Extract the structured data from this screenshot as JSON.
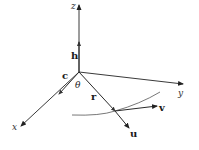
{
  "diagram": {
    "type": "3d-vector-diagram",
    "axes": {
      "x": {
        "label": "x"
      },
      "y": {
        "label": "y"
      },
      "z": {
        "label": "z"
      }
    },
    "vectors": {
      "h": {
        "label": "h"
      },
      "c": {
        "label": "c"
      },
      "r": {
        "label": "r"
      },
      "u": {
        "label": "u"
      },
      "v": {
        "label": "v"
      }
    },
    "angle": {
      "label": "θ"
    },
    "colors": {
      "line": "#3a3a3a",
      "text": "#1a1a1a",
      "background": "#ffffff"
    }
  }
}
